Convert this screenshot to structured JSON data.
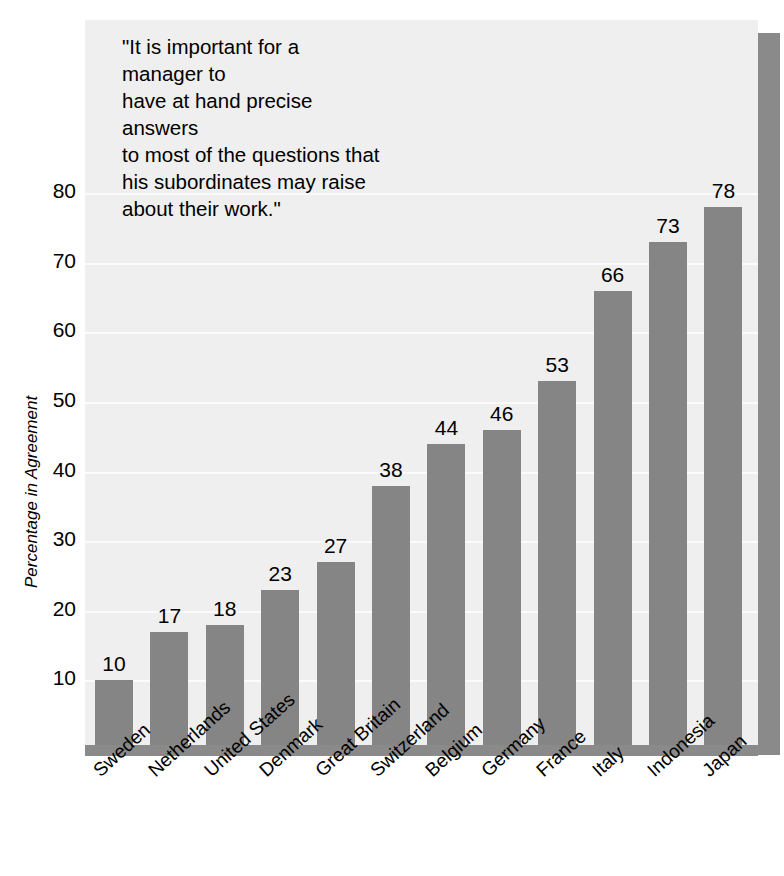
{
  "chart_data": {
    "type": "bar",
    "title": "",
    "subtitle": "",
    "xlabel": "",
    "ylabel": "Percentage in Agreement",
    "ylim": [
      0,
      88
    ],
    "yticks": [
      10,
      20,
      30,
      40,
      50,
      60,
      70,
      80
    ],
    "ytick_labels": [
      "10",
      "20",
      "30",
      "40",
      "50",
      "60",
      "70",
      "80"
    ],
    "grid": true,
    "grid_axis": "y",
    "legend": "none",
    "orientation": "vertical",
    "bar_color": "#858585",
    "plot_background": "#efefef",
    "gridline_color": "#fbfbfb",
    "frame_color": "#8a8a8a",
    "data_labels": true,
    "categories": [
      "Sweden",
      "Netherlands",
      "United States",
      "Denmark",
      "Great Britain",
      "Switzerland",
      "Belgium",
      "Germany",
      "France",
      "Italy",
      "Indonesia",
      "Japan"
    ],
    "values": [
      10,
      17,
      18,
      23,
      27,
      38,
      44,
      46,
      53,
      66,
      73,
      78
    ],
    "value_labels": [
      "10",
      "17",
      "18",
      "23",
      "27",
      "38",
      "44",
      "46",
      "53",
      "66",
      "73",
      "78"
    ],
    "annotations": [
      {
        "name": "survey-question-quote",
        "text": "\"It is important for a manager to have at hand precise answers to most of the questions that his subordinates may raise about their work.\"",
        "lines": [
          "\"It is important for a manager to",
          "have at hand precise answers",
          "to most of the questions that",
          "his subordinates may raise",
          "about their work.\""
        ]
      }
    ]
  }
}
